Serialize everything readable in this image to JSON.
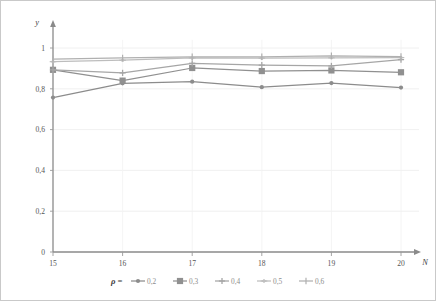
{
  "chart_data": {
    "type": "line",
    "title": "",
    "xlabel": "N",
    "ylabel": "y",
    "x": [
      15,
      16,
      17,
      18,
      19,
      20
    ],
    "xticklabels": [
      "15",
      "16",
      "17",
      "18",
      "19",
      "20"
    ],
    "yticklabels": [
      "0",
      "0,2",
      "0,4",
      "0,6",
      "0,8",
      "1"
    ],
    "yticks": [
      0,
      0.2,
      0.4,
      0.6,
      0.8,
      1
    ],
    "xlim": [
      15,
      20
    ],
    "ylim": [
      0,
      1.04
    ],
    "grid": true,
    "legend_position": "bottom",
    "legend_title": "ρ =",
    "series": [
      {
        "name": "0,2",
        "values": [
          0.757,
          0.827,
          0.835,
          0.808,
          0.828,
          0.806
        ],
        "color": "#8c8c8c",
        "marker": "circle"
      },
      {
        "name": "0,3",
        "values": [
          0.893,
          0.84,
          0.902,
          0.887,
          0.89,
          0.881
        ],
        "color": "#909090",
        "marker": "square"
      },
      {
        "name": "0,4",
        "values": [
          0.893,
          0.878,
          0.925,
          0.916,
          0.912,
          0.943
        ],
        "color": "#a6a6a6",
        "marker": "cross"
      },
      {
        "name": "0,5",
        "values": [
          0.933,
          0.94,
          0.951,
          0.95,
          0.952,
          0.953
        ],
        "color": "#bdbdbd",
        "marker": "dash"
      },
      {
        "name": "0,6",
        "values": [
          0.946,
          0.951,
          0.957,
          0.957,
          0.962,
          0.958
        ],
        "color": "#b0b0b0",
        "marker": "tick"
      }
    ]
  },
  "axis": {
    "y_label": "y",
    "x_label": "N"
  }
}
